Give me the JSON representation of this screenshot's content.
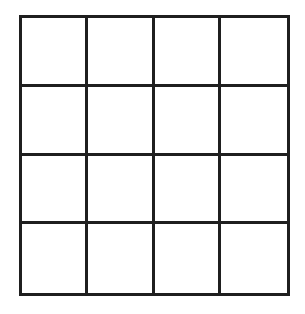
{
  "board": {
    "rows": 4,
    "cols": 4,
    "line_color": "#1f1f1f",
    "background_color": "#ffffff",
    "cells": [
      [
        "",
        "",
        "",
        ""
      ],
      [
        "",
        "",
        "",
        ""
      ],
      [
        "",
        "",
        "",
        ""
      ],
      [
        "",
        "",
        "",
        ""
      ]
    ]
  }
}
